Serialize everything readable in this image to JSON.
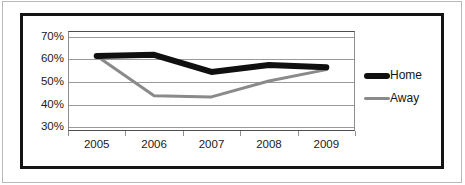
{
  "chart_data": {
    "type": "line",
    "title": "",
    "xlabel": "",
    "ylabel": "",
    "categories": [
      "2005",
      "2006",
      "2007",
      "2008",
      "2009"
    ],
    "ytick_labels": [
      "70%",
      "60%",
      "50%",
      "40%",
      "30%"
    ],
    "ytick_values": [
      70,
      60,
      50,
      40,
      30
    ],
    "ylim": [
      28,
      72
    ],
    "grid": true,
    "legend_position": "right",
    "series": [
      {
        "name": "Home",
        "color": "#101010",
        "line_width": 6,
        "values": [
          61,
          61.5,
          54,
          57,
          56
        ]
      },
      {
        "name": "Away",
        "color": "#8a8a8a",
        "line_width": 3,
        "values": [
          61,
          43.5,
          43,
          50,
          55
        ]
      }
    ]
  },
  "legend": {
    "items": [
      {
        "label": "Home",
        "swatch": "thick-black-line-icon"
      },
      {
        "label": "Away",
        "swatch": "thin-gray-line-icon"
      }
    ]
  },
  "colors": {
    "home": "#101010",
    "away": "#8a8a8a",
    "gridline": "#9a9a9a",
    "axis": "#4d4d4d",
    "frame": "#141414",
    "outer_rule": "#b9b9b9",
    "text": "#1a1a1a",
    "background": "#ffffff"
  }
}
